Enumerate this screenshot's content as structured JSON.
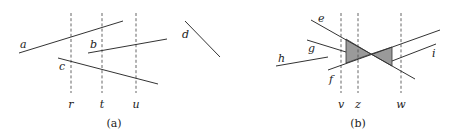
{
  "figure": {
    "panel_a": {
      "caption": "(a)",
      "segments": [
        {
          "label": "a",
          "x1": 19,
          "y1": 53,
          "x2": 123,
          "y2": 21,
          "lx": 20,
          "ly": 48
        },
        {
          "label": "b",
          "x1": 88,
          "y1": 53,
          "x2": 167,
          "y2": 39,
          "lx": 90,
          "ly": 48
        },
        {
          "label": "c",
          "x1": 58,
          "y1": 58,
          "x2": 158,
          "y2": 84,
          "lx": 59,
          "ly": 70
        },
        {
          "label": "d",
          "x1": 185,
          "y1": 21,
          "x2": 220,
          "y2": 57,
          "lx": 182,
          "ly": 38
        }
      ],
      "sweep_lines": [
        {
          "label": "r",
          "x": 71,
          "y1": 13,
          "y2": 93
        },
        {
          "label": "t",
          "x": 102,
          "y1": 13,
          "y2": 93
        },
        {
          "label": "u",
          "x": 136,
          "y1": 13,
          "y2": 93
        }
      ]
    },
    "panel_b": {
      "caption": "(b)",
      "segments": [
        {
          "label": "e",
          "x1": 311,
          "y1": 20,
          "x2": 415,
          "y2": 79,
          "lx": 318,
          "ly": 22
        },
        {
          "label": "f",
          "x1": 328,
          "y1": 70,
          "x2": 440,
          "y2": 30,
          "lx": 329,
          "ly": 83
        },
        {
          "label": "g",
          "x1": 307,
          "y1": 40,
          "x2": 346,
          "y2": 52,
          "lx": 308,
          "ly": 52
        },
        {
          "label": "h",
          "x1": 276,
          "y1": 66,
          "x2": 328,
          "y2": 57,
          "lx": 278,
          "ly": 62
        },
        {
          "label": "i",
          "x1": 392,
          "y1": 61,
          "x2": 436,
          "y2": 44,
          "lx": 432,
          "ly": 57
        }
      ],
      "sweep_lines": [
        {
          "label": "v",
          "x": 341,
          "y1": 13,
          "y2": 93
        },
        {
          "label": "z",
          "x": 358,
          "y1": 13,
          "y2": 93
        },
        {
          "label": "w",
          "x": 401,
          "y1": 13,
          "y2": 93
        }
      ],
      "shaded_regions": [
        {
          "name": "left-wedge",
          "points": "346,39 371,54 346,63"
        },
        {
          "name": "right-wedge",
          "points": "371,54 392,47 392,66"
        }
      ]
    }
  }
}
